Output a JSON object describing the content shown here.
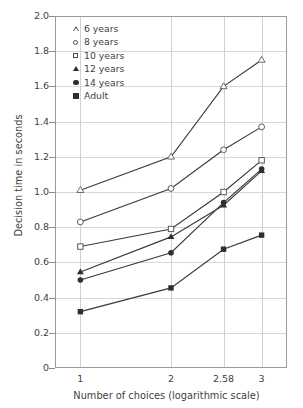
{
  "chart_data": {
    "type": "line",
    "title": "",
    "xlabel": "Number of choices (logarithmic scale)",
    "ylabel": "Decision time in seconds",
    "x": [
      1,
      2,
      2.58,
      3
    ],
    "xticklabels": [
      "1",
      "2",
      "2.58",
      "3"
    ],
    "yticklabels": [
      "0",
      "0.2",
      "0.4",
      "0.6",
      "0.8",
      "1.0",
      "1.2",
      "1.4",
      "1.6",
      "1.8",
      "2.0"
    ],
    "ytickvalues": [
      0,
      0.2,
      0.4,
      0.6,
      0.8,
      1.0,
      1.2,
      1.4,
      1.6,
      1.8,
      2.0
    ],
    "ylim": [
      0,
      2.0
    ],
    "xlim": [
      0.72,
      3.28
    ],
    "grid": true,
    "legend_position": "top-left-inside",
    "series": [
      {
        "name": "6 years",
        "marker": "triangle-open",
        "values": [
          1.01,
          1.2,
          1.6,
          1.75
        ]
      },
      {
        "name": "8 years",
        "marker": "circle-open",
        "values": [
          0.83,
          1.02,
          1.24,
          1.37
        ]
      },
      {
        "name": "10 years",
        "marker": "square-open",
        "values": [
          0.69,
          0.79,
          1.0,
          1.18
        ]
      },
      {
        "name": "12 years",
        "marker": "triangle-filled",
        "values": [
          0.545,
          0.745,
          0.925,
          1.12
        ]
      },
      {
        "name": "14 years",
        "marker": "circle-filled",
        "values": [
          0.5,
          0.655,
          0.94,
          1.13
        ]
      },
      {
        "name": "Adult",
        "marker": "square-filled",
        "values": [
          0.32,
          0.455,
          0.675,
          0.755
        ]
      }
    ],
    "line_color": "#3a3a3a",
    "grid_color": "#d8d8d8",
    "axis_color": "#9a9a9a"
  }
}
